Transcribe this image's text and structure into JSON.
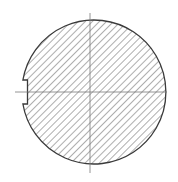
{
  "diagram": {
    "type": "cross-section",
    "colors": {
      "outline": "#3a3a3a",
      "hatch": "#6a6a6a",
      "centerline": "#7a7a7a",
      "background": "#ffffff"
    },
    "circle": {
      "cx": 90,
      "cy": 92,
      "r": 72
    },
    "keyway": {
      "side": "left",
      "top_y": 80,
      "bottom_y": 104,
      "depth": 5
    },
    "centerlines": {
      "horizontal": {
        "x1": 15,
        "x2": 167,
        "y": 92
      },
      "vertical": {
        "x": 90,
        "y1": 13,
        "y2": 173
      }
    },
    "hatch_spacing": 5
  }
}
